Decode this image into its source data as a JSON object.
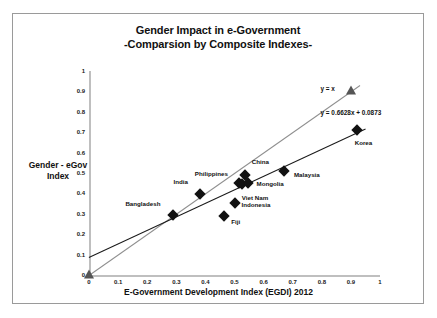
{
  "chart_data": {
    "type": "scatter",
    "title": "Gender Impact in e-Government",
    "subtitle": "-Comparsion by Composite Indexes-",
    "xlabel": "E-Government Development Index (EGDI) 2012",
    "ylabel": "Gender - eGov Index",
    "xlim": [
      0,
      1
    ],
    "ylim": [
      0,
      1
    ],
    "grid": false,
    "legend": "none",
    "xticks": [
      "0",
      "0.1",
      "0.2",
      "0.3",
      "0.4",
      "0.5",
      "0.6",
      "0.7",
      "0.8",
      "0.9",
      "1"
    ],
    "yticks": [
      "0",
      "0.1",
      "0.2",
      "0.3",
      "0.4",
      "0.5",
      "0.6",
      "0.7",
      "0.8",
      "0.9",
      "1"
    ],
    "xtick_values": [
      0,
      0.1,
      0.2,
      0.3,
      0.4,
      0.5,
      0.6,
      0.7,
      0.8,
      0.9,
      1
    ],
    "ytick_values": [
      0,
      0.1,
      0.2,
      0.3,
      0.4,
      0.5,
      0.6,
      0.7,
      0.8,
      0.9,
      1
    ],
    "points": [
      {
        "label": "Bangladesh",
        "x": 0.29,
        "y": 0.295,
        "marker": "diamond",
        "label_dx": -48,
        "label_dy": -12
      },
      {
        "label": "India",
        "x": 0.38,
        "y": 0.395,
        "marker": "diamond",
        "label_dx": -26,
        "label_dy": -13
      },
      {
        "label": "Fiji",
        "x": 0.465,
        "y": 0.29,
        "marker": "diamond",
        "label_dx": 7,
        "label_dy": 5
      },
      {
        "label": "Indonesia",
        "x": 0.5,
        "y": 0.355,
        "marker": "diamond",
        "label_dx": 7,
        "label_dy": 1
      },
      {
        "label": "Philippines",
        "x": 0.515,
        "y": 0.45,
        "marker": "diamond",
        "label_dx": -44,
        "label_dy": -10
      },
      {
        "label": "Viet Nam",
        "x": 0.525,
        "y": 0.445,
        "marker": "diamond",
        "label_dx": 0,
        "label_dy": 13
      },
      {
        "label": "China",
        "x": 0.535,
        "y": 0.49,
        "marker": "diamond",
        "label_dx": 7,
        "label_dy": -14
      },
      {
        "label": "Mongolia",
        "x": 0.545,
        "y": 0.45,
        "marker": "diamond",
        "label_dx": 9,
        "label_dy": 0
      },
      {
        "label": "Malaysia",
        "x": 0.67,
        "y": 0.51,
        "marker": "diamond",
        "label_dx": 10,
        "label_dy": 3
      },
      {
        "label": "Korea",
        "x": 0.92,
        "y": 0.71,
        "marker": "diamond",
        "label_dx": -2,
        "label_dy": 12
      }
    ],
    "reference_markers": [
      {
        "name": "origin-triangle",
        "x": 0.0,
        "y": 0.0,
        "marker": "triangle"
      },
      {
        "name": "identity-triangle",
        "x": 0.9,
        "y": 0.9,
        "marker": "triangle"
      }
    ],
    "series": [
      {
        "name": "identity-line",
        "equation_label": "y = x",
        "slope": 1,
        "intercept": 0,
        "x_start": 0,
        "x_end": 0.93,
        "color": "#8f8f8f",
        "label_x": 0.82,
        "label_y": 0.915
      },
      {
        "name": "regression-line",
        "equation_label": "y = 0.6628x + 0.0873",
        "slope": 0.6628,
        "intercept": 0.0873,
        "x_start": 0.0,
        "x_end": 0.95,
        "color": "#1a1a1a",
        "label_x": 0.9,
        "label_y": 0.8
      }
    ]
  }
}
